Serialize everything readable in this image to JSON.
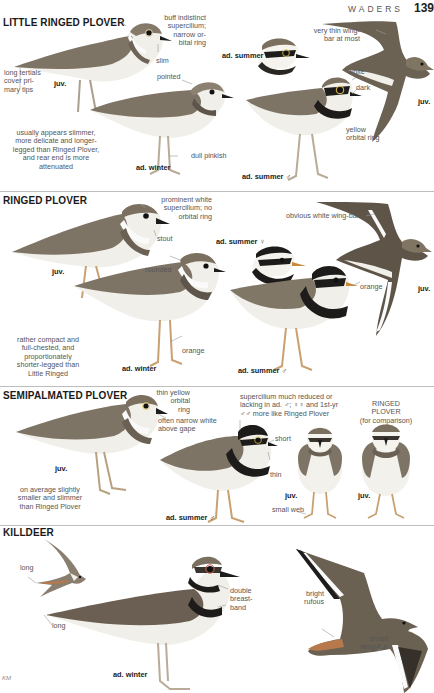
{
  "header": {
    "section": "WADERS",
    "page_number": "139"
  },
  "sections": [
    {
      "title": "LITTLE RINGED PLOVER",
      "notes": {
        "supercilium": "buff indistinct supercilium; narrow orbital ring",
        "supercilium_lines": [
          "buff indistinct",
          "supercilium;",
          "narrow or-",
          "bital ring"
        ],
        "tertials_lines": [
          "long tertials",
          "cover pri-",
          "mary tips"
        ],
        "slim": "slim",
        "pointed": "pointed",
        "overall_lines": [
          "usually appears slimmer,",
          "more delicate and longer-",
          "legged than Ringed Plover,",
          "and rear end is more",
          "attenuated"
        ],
        "legs": "dull pinkish",
        "wingbar_lines": [
          "very thin wing-",
          "bar at most"
        ],
        "white": "white",
        "dark": "dark",
        "orbital_lines": [
          "yellow",
          "orbital ring"
        ]
      },
      "plumages": {
        "juv": "juv.",
        "ad_winter": "ad. winter",
        "ad_summer_female": "ad. summer ♀",
        "ad_summer_male": "ad. summer ♂",
        "juv_flight": "juv."
      }
    },
    {
      "title": "RINGED PLOVER",
      "notes": {
        "supercilium_lines": [
          "prominent white",
          "supercilium; no",
          "orbital ring"
        ],
        "stout": "stout",
        "wingbar": "obvious white wing-bar",
        "rounded": "rounded",
        "overall_lines": [
          "rather compact and",
          "full-chested, and",
          "proportionately",
          "shorter-legged than",
          "Little Ringed"
        ],
        "legs": "orange",
        "bill": "orange"
      },
      "plumages": {
        "juv": "juv.",
        "ad_winter": "ad. winter",
        "ad_summer_female": "ad. summer ♀",
        "ad_summer_male": "ad. summer ♂",
        "juv_flight": "juv."
      }
    },
    {
      "title": "SEMIPALMATED PLOVER",
      "notes": {
        "orbital_lines": [
          "thin yellow",
          "orbital",
          "ring"
        ],
        "gape_lines": [
          "often narrow white",
          "above gape"
        ],
        "supercilium_lines": [
          "supercilium much reduced or",
          "lacking in ad. ♂; ♀♀ and 1st-yr",
          "♂♂ more like Ringed Plover"
        ],
        "short": "short",
        "thin": "thin",
        "overall_lines": [
          "on average slightly",
          "smaller and slimmer",
          "than Ringed Plover"
        ],
        "web": "small web",
        "comparison_lines": [
          "RINGED",
          "PLOVER",
          "(for comparison)"
        ]
      },
      "plumages": {
        "juv": "juv.",
        "ad_summer_male": "ad. summer ♂",
        "juv_front": "juv.",
        "juv_ringed_front": "juv."
      }
    },
    {
      "title": "KILLDEER",
      "notes": {
        "long_flight": "long",
        "long_tail": "long",
        "breastband_lines": [
          "double",
          "breast-",
          "band"
        ],
        "rump_lines": [
          "bright",
          "rufous"
        ],
        "wingbar_lines": [
          "broad",
          "wing-bar"
        ]
      },
      "plumages": {
        "ad_winter": "ad. winter"
      }
    }
  ],
  "signature": "KM",
  "colors": {
    "mantle": "#7e7466",
    "mantle_dark": "#5d554b",
    "belly": "#f1efe9",
    "band": "#1e1c1a",
    "legs_pink": "#b9ab97",
    "legs_orange": "#c9a070",
    "rufous": "#b7794c",
    "divider": "#bdbdbd"
  }
}
